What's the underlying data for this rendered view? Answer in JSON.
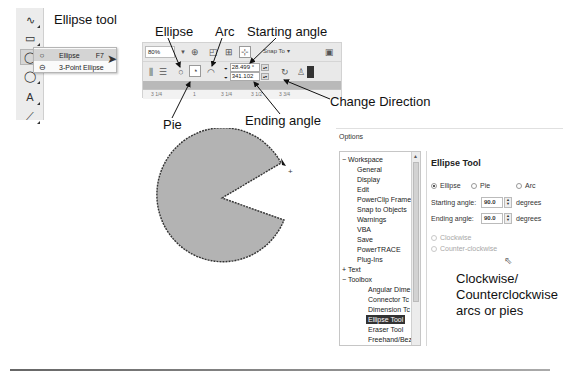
{
  "toolbox": {
    "tools": [
      {
        "name": "freehand-tool",
        "glyph": "∿"
      },
      {
        "name": "rectangle-tool",
        "glyph": "▭"
      },
      {
        "name": "ellipse-tool",
        "glyph": "◯",
        "active": true
      },
      {
        "name": "polygon-tool",
        "glyph": "◯"
      },
      {
        "name": "text-tool",
        "glyph": "A"
      },
      {
        "name": "connector-tool",
        "glyph": "⟋"
      }
    ],
    "flyout": {
      "items": [
        {
          "label": "Ellipse",
          "shortcut": "F7",
          "glyph": "○",
          "highlighted": true
        },
        {
          "label": "3-Point Ellipse",
          "shortcut": "",
          "glyph": "⊖"
        }
      ]
    }
  },
  "callouts": {
    "ellipse_tool": "Ellipse tool",
    "ellipse": "Ellipse",
    "arc": "Arc",
    "starting_angle": "Starting angle",
    "pie": "Pie",
    "ending_angle": "Ending angle",
    "change_direction": "Change Direction",
    "clockwise_note": [
      "Clockwise/",
      "Counterclockwise",
      "arcs or pies"
    ]
  },
  "property_bar": {
    "zoom_level": "80%",
    "snap_to_label": "Snap To",
    "starting_angle": "28.499 °",
    "ending_angle": "341.102",
    "ruler_marks": [
      "3 1/4",
      "1",
      "3 1/4",
      "3 1/2",
      "3 3/4"
    ]
  },
  "options_dialog": {
    "title": "Options",
    "tree": [
      {
        "label": "Workspace",
        "level": 0,
        "expander": "−"
      },
      {
        "label": "General",
        "level": 1
      },
      {
        "label": "Display",
        "level": 1
      },
      {
        "label": "Edit",
        "level": 1
      },
      {
        "label": "PowerClip Frame",
        "level": 1
      },
      {
        "label": "Snap to Objects",
        "level": 1
      },
      {
        "label": "Warnings",
        "level": 1
      },
      {
        "label": "VBA",
        "level": 1
      },
      {
        "label": "Save",
        "level": 1
      },
      {
        "label": "PowerTRACE",
        "level": 1
      },
      {
        "label": "Plug-Ins",
        "level": 1
      },
      {
        "label": "Text",
        "level": 0,
        "expander": "+"
      },
      {
        "label": "Toolbox",
        "level": 0,
        "expander": "−"
      },
      {
        "label": "Angular Dime",
        "level": 2
      },
      {
        "label": "Connector Tc",
        "level": 2
      },
      {
        "label": "Dimension Tc",
        "level": 2
      },
      {
        "label": "Ellipse Tool",
        "level": 2,
        "selected": true
      },
      {
        "label": "Eraser Tool",
        "level": 2
      },
      {
        "label": "Freehand/Bez",
        "level": 2
      },
      {
        "label": "Graph Paper",
        "level": 2
      }
    ],
    "panel": {
      "title": "Ellipse Tool",
      "type_options": [
        {
          "label": "Ellipse",
          "checked": true
        },
        {
          "label": "Pie",
          "checked": false
        },
        {
          "label": "Arc",
          "checked": false
        }
      ],
      "starting_angle_label": "Starting angle:",
      "starting_angle_value": "90.0",
      "ending_angle_label": "Ending angle:",
      "ending_angle_value": "90.0",
      "unit": "degrees",
      "direction_options": [
        {
          "label": "Clockwise",
          "checked": false,
          "disabled": true
        },
        {
          "label": "Counter-clockwise",
          "checked": false,
          "disabled": true
        }
      ]
    }
  },
  "colors": {
    "pie_fill": "#b3b3b3",
    "pie_stroke": "#333333",
    "selected_tree_bg": "#333333"
  }
}
